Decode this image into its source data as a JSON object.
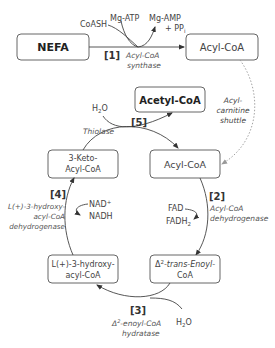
{
  "diagram": {
    "type": "beta-oxidation pathway",
    "nodes": {
      "nefa": "NEFA",
      "acyl_coa_top": "Acyl-CoA",
      "acetyl_coa": "Acetyl-CoA",
      "keto_acyl_coa_line1": "3-Keto-",
      "keto_acyl_coa_line2": "Acyl-CoA",
      "acyl_coa_mid": "Acyl-CoA",
      "hydroxy_acyl_coa_line1": "L(+)-3-hydroxy-",
      "hydroxy_acyl_coa_line2": "acyl-CoA",
      "enoyl_coa_line1_delta": "Δ",
      "enoyl_coa_line1_sup": "2",
      "enoyl_coa_line1_rest": "-trans-Enoyl-",
      "enoyl_coa_line2": "CoA"
    },
    "steps": {
      "s1": {
        "number": "[1]",
        "enzyme_line1": "Acyl-CoA",
        "enzyme_line2": "synthase",
        "inputs": [
          "CoASH",
          "Mg-ATP"
        ],
        "output_line1": "Mg-AMP",
        "output_line2_prefix": "+ PP",
        "output_line2_sub": "i"
      },
      "s2": {
        "number": "[2]",
        "enzyme_line1": "Acyl-CoA",
        "enzyme_line2": "dehydrogenase",
        "input": "FAD",
        "output_prefix": "FADH",
        "output_sub": "2"
      },
      "s3": {
        "number": "[3]",
        "enzyme_line1_delta": "Δ",
        "enzyme_line1_sup": "2",
        "enzyme_line1_rest": "-enoyl-CoA",
        "enzyme_line2": "hydratase",
        "input_prefix": "H",
        "input_sub": "2",
        "input_suffix": "O"
      },
      "s4": {
        "number": "[4]",
        "enzyme_line1": "L(+)-3-hydroxy-",
        "enzyme_line2": "acyl-CoA",
        "enzyme_line3": "dehydrogenase",
        "input_prefix": "NAD",
        "input_sup": "+",
        "output": "NADH"
      },
      "s5": {
        "number": "[5]",
        "enzyme": "Thiolase",
        "input_prefix": "H",
        "input_sub": "2",
        "input_suffix": "O"
      }
    },
    "shuttle": {
      "line1": "Acyl-",
      "line2": "carnitine",
      "line3": "shuttle"
    },
    "colors": {
      "box_stroke": "#555555",
      "text": "#444444",
      "dotted_arrow": "#999999"
    }
  }
}
